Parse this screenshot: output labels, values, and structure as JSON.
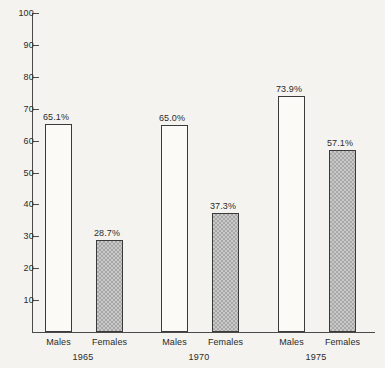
{
  "chart_data": {
    "type": "bar",
    "title": "",
    "subtitle": "",
    "xlabel": "",
    "ylabel": "",
    "ylim": [
      0,
      100
    ],
    "ytick_labels": [
      "100",
      "90",
      "80",
      "70",
      "60",
      "50",
      "40",
      "30",
      "20",
      "10"
    ],
    "yticks": [
      100,
      90,
      80,
      70,
      60,
      50,
      40,
      30,
      20,
      10
    ],
    "grid": false,
    "legend": "none",
    "categories": [
      "1965",
      "1970",
      "1975"
    ],
    "series": [
      {
        "name": "Males",
        "values": [
          65.1,
          65.0,
          73.9
        ],
        "labels": [
          "65.1%",
          "65.0%",
          "73.9%"
        ],
        "fill": "white",
        "color": "#fbfaf7"
      },
      {
        "name": "Females",
        "values": [
          28.7,
          37.3,
          57.1
        ],
        "labels": [
          "28.7%",
          "37.3%",
          "57.1%"
        ],
        "fill": "gray-checker",
        "color": "#c9c9c9"
      }
    ],
    "bars": [
      {
        "group": "1965",
        "series": "Males",
        "value": 65.1,
        "label": "65.1%",
        "cat_label": "Males",
        "style": "males"
      },
      {
        "group": "1965",
        "series": "Females",
        "value": 28.7,
        "label": "28.7%",
        "cat_label": "Females",
        "style": "females"
      },
      {
        "group": "1970",
        "series": "Males",
        "value": 65.0,
        "label": "65.0%",
        "cat_label": "Males",
        "style": "males"
      },
      {
        "group": "1970",
        "series": "Females",
        "value": 37.3,
        "label": "37.3%",
        "cat_label": "Females",
        "style": "females"
      },
      {
        "group": "1975",
        "series": "Males",
        "value": 73.9,
        "label": "73.9%",
        "cat_label": "Males",
        "style": "males"
      },
      {
        "group": "1975",
        "series": "Females",
        "value": 57.1,
        "label": "57.1%",
        "cat_label": "Females",
        "style": "females"
      }
    ]
  },
  "colors": {
    "background": "#f4f3ef",
    "axis": "#4a4a4a",
    "text": "#2b2b2b",
    "bar_border": "#3a3a3a",
    "bar_males": "#fbfaf7",
    "bar_females": "#c9c9c9"
  }
}
